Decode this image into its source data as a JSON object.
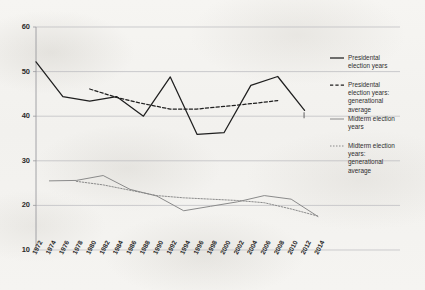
{
  "chart_data": {
    "type": "line",
    "title": "",
    "xlabel": "",
    "ylabel": "",
    "ylim": [
      10,
      60
    ],
    "yticks": [
      10,
      20,
      30,
      40,
      50,
      60
    ],
    "grid": true,
    "legend_position": "right",
    "categories": [
      "1972",
      "1974",
      "1976",
      "1978",
      "1980",
      "1982",
      "1984",
      "1986",
      "1988",
      "1990",
      "1992",
      "1994",
      "1996",
      "1998",
      "2000",
      "2002",
      "2004",
      "2006",
      "2008",
      "2010",
      "2012",
      "2014"
    ],
    "series": [
      {
        "name": "Presidental election years",
        "style": "solid",
        "color": "#1f1f1f",
        "x": [
          "1972",
          "1976",
          "1980",
          "1984",
          "1988",
          "1992",
          "1996",
          "2000",
          "2004",
          "2008",
          "2012"
        ],
        "values": [
          52.2,
          44.4,
          43.4,
          44.4,
          40.0,
          48.8,
          35.9,
          36.3,
          46.9,
          48.9,
          41.3
        ]
      },
      {
        "name": "Presidental election years: generational average",
        "style": "dashed",
        "color": "#1f1f1f",
        "x": [
          "1980",
          "1984",
          "1988",
          "1992",
          "1996",
          "2000",
          "2004",
          "2008"
        ],
        "values": [
          46.1,
          44.2,
          42.8,
          41.6,
          41.6,
          42.2,
          42.8,
          43.5
        ]
      },
      {
        "name": "Midterm election years",
        "style": "solid",
        "color": "#8a8a8a",
        "x": [
          "1974",
          "1978",
          "1982",
          "1986",
          "1990",
          "1994",
          "1998",
          "2002",
          "2006",
          "2010",
          "2014"
        ],
        "values": [
          25.5,
          25.6,
          26.7,
          23.6,
          22.1,
          18.8,
          19.8,
          20.8,
          22.2,
          21.4,
          17.5
        ]
      },
      {
        "name": "Midterm election years: generational average",
        "style": "dotted",
        "color": "#8a8a8a",
        "x": [
          "1978",
          "1982",
          "1986",
          "1990",
          "1994",
          "1998",
          "2002",
          "2006",
          "2010",
          "2014"
        ],
        "values": [
          25.4,
          24.6,
          23.4,
          22.2,
          21.7,
          21.4,
          21.1,
          20.6,
          19.2,
          17.6
        ]
      }
    ]
  },
  "legend": {
    "items": [
      {
        "label": "Presidental election years",
        "style": "solid",
        "color": "#1f1f1f"
      },
      {
        "label": "Presidental election years: generational average",
        "style": "dashed",
        "color": "#1f1f1f"
      },
      {
        "label": "Midterm election years",
        "style": "solid",
        "color": "#8a8a8a"
      },
      {
        "label": "Midterm election years: generational average",
        "style": "dotted",
        "color": "#8a8a8a"
      }
    ]
  },
  "axes": {
    "y_tick_labels": [
      "60",
      "50",
      "40",
      "30",
      "20",
      "10"
    ],
    "x_tick_labels": [
      "1972",
      "1974",
      "1976",
      "1978",
      "1980",
      "1982",
      "1984",
      "1986",
      "1988",
      "1990",
      "1992",
      "1994",
      "1996",
      "1998",
      "2000",
      "2002",
      "2004",
      "2006",
      "2008",
      "2010",
      "2012",
      "2014"
    ]
  },
  "colors": {
    "presidential": "#1f1f1f",
    "midterm": "#8a8a8a",
    "grid": "#b9b9bd",
    "axis": "#9a9a9e",
    "background": "#f4f3f0"
  }
}
